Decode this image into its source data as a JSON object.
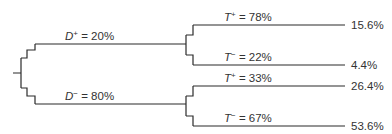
{
  "diagram": {
    "type": "probability-tree",
    "root": {
      "branches": [
        {
          "id": "d-pos",
          "variable": "D",
          "sign": "+",
          "eq": " = ",
          "percent": "20%",
          "children": [
            {
              "id": "d-pos-t-pos",
              "variable": "T",
              "sign": "+",
              "eq": " = ",
              "percent": "78%",
              "joint": "15.6%"
            },
            {
              "id": "d-pos-t-neg",
              "variable": "T",
              "sign": "−",
              "eq": " = ",
              "percent": "22%",
              "joint": "4.4%"
            }
          ]
        },
        {
          "id": "d-neg",
          "variable": "D",
          "sign": "−",
          "eq": " = ",
          "percent": "80%",
          "children": [
            {
              "id": "d-neg-t-pos",
              "variable": "T",
              "sign": "+",
              "eq": " = ",
              "percent": "33%",
              "joint": "26.4%"
            },
            {
              "id": "d-neg-t-neg",
              "variable": "T",
              "sign": "−",
              "eq": " = ",
              "percent": "67%",
              "joint": "53.6%"
            }
          ]
        }
      ]
    },
    "line_color": "#2b2b2b"
  }
}
